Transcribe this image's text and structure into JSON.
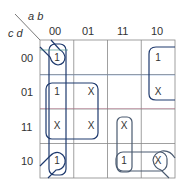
{
  "diagram": {
    "type": "karnaugh-map",
    "variables": {
      "column": "a b",
      "row": "c d"
    },
    "column_labels": [
      "00",
      "01",
      "11",
      "10"
    ],
    "row_labels": [
      "00",
      "01",
      "11",
      "10"
    ],
    "cells": [
      [
        "1",
        "",
        "",
        "1"
      ],
      [
        "1",
        "X",
        "",
        "X"
      ],
      [
        "X",
        "X",
        "X",
        ""
      ],
      [
        "1",
        "",
        "1",
        "X"
      ]
    ],
    "groups": [
      {
        "name": "corners",
        "cells": [
          "00-00",
          "00-10",
          "10-00",
          "10-10"
        ],
        "color": "#1f3a6e"
      },
      {
        "name": "column-00",
        "cells": [
          "00-00",
          "01-00",
          "11-00",
          "10-00"
        ],
        "color": "#1f3a6e"
      },
      {
        "name": "square-00-01",
        "cells": [
          "01-00",
          "01-01",
          "11-00",
          "11-01"
        ],
        "color": "#1f3a6e"
      },
      {
        "name": "column-10-top",
        "cells": [
          "00-10",
          "01-10"
        ],
        "color": "#1f3a6e"
      },
      {
        "name": "pair-11-vertical",
        "cells": [
          "11-11",
          "10-11"
        ],
        "color": "#4a5a70"
      },
      {
        "name": "pair-10-horizontal",
        "cells": [
          "10-11",
          "10-10"
        ],
        "color": "#4a5a70"
      }
    ]
  }
}
